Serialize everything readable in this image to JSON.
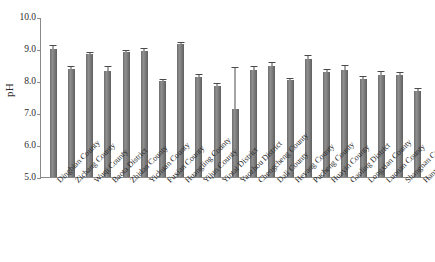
{
  "chart_data": {
    "type": "bar",
    "title": "",
    "xlabel": "",
    "ylabel": "pH",
    "ylim": [
      5.0,
      10.0
    ],
    "yticks": [
      "10.0",
      "9.0",
      "8.0",
      "7.0",
      "6.0",
      "5.0"
    ],
    "ytick_values": [
      10.0,
      9.0,
      8.0,
      7.0,
      6.0,
      5.0
    ],
    "grid": false,
    "legend": null,
    "bar_color": "#777777",
    "error_bar_color": "#4a4a4a",
    "categories": [
      "Dingbian County",
      "Zichang County",
      "Wuqi County",
      "Baota District",
      "Zhidan County",
      "Yichuan County",
      "Fuxian County",
      "Huangling County",
      "Yijun County",
      "Yintai District",
      "Yaozhou District",
      "Chengcheng County",
      "Dali County",
      "Heyang County",
      "Pucheng County",
      "Huayin County",
      "Gaoling District",
      "Longxian County",
      "Luonan County",
      "Shangnan County",
      "Hanyin County"
    ],
    "values": [
      8.99,
      8.37,
      8.84,
      8.3,
      8.91,
      8.95,
      8.0,
      9.15,
      8.11,
      7.85,
      7.12,
      8.35,
      8.48,
      8.02,
      8.7,
      8.27,
      8.33,
      8.07,
      8.2,
      8.18,
      7.68
    ],
    "errors": [
      0.1,
      0.06,
      0.04,
      0.13,
      0.04,
      0.04,
      0.02,
      0.03,
      0.07,
      0.06,
      1.28,
      0.08,
      0.08,
      0.05,
      0.09,
      0.07,
      0.13,
      0.06,
      0.07,
      0.06,
      0.06
    ]
  }
}
